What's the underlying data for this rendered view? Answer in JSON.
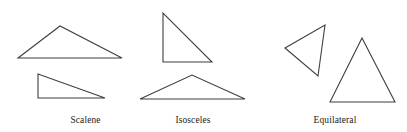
{
  "figure": {
    "background_color": "#ffffff",
    "stroke_color": "#3f3f42",
    "width": 407,
    "height": 132
  },
  "groups": [
    {
      "key": "scalene",
      "label": "Scalene",
      "description": "Triangles with three unequal sides",
      "shapes": [
        {
          "name": "scalene-obtuse-triangle",
          "points": "18,58 60,26 122,58",
          "orientation": "apex-up-left-of-center"
        },
        {
          "name": "scalene-right-triangle",
          "points": "38,74 38,98 105,98",
          "orientation": "right-angle-bottom-left"
        }
      ]
    },
    {
      "key": "isosceles",
      "label": "Isosceles",
      "description": "Triangles with two equal sides",
      "shapes": [
        {
          "name": "isosceles-right-triangle",
          "points": "163,13 163,62 212,62",
          "orientation": "right-angle-bottom-left"
        },
        {
          "name": "isosceles-wide-triangle",
          "points": "140,99 192,75 245,99",
          "orientation": "apex-up-centered"
        }
      ]
    },
    {
      "key": "equilateral",
      "label": "Equilateral",
      "description": "Triangles with three equal sides",
      "shapes": [
        {
          "name": "equilateral-tilted-triangle",
          "points": "285,48 325,25 318,76",
          "orientation": "rotated"
        },
        {
          "name": "equilateral-upright-triangle",
          "points": "330,102 362,38 395,102",
          "orientation": "apex-up-centered"
        }
      ]
    }
  ],
  "chart_data": {
    "type": "diagram",
    "categories": [
      "Scalene",
      "Isosceles",
      "Equilateral"
    ],
    "items": [
      {
        "category": "Scalene",
        "count": 2,
        "examples": [
          "obtuse scalene",
          "right scalene"
        ]
      },
      {
        "category": "Isosceles",
        "count": 2,
        "examples": [
          "right isosceles",
          "wide isosceles"
        ]
      },
      {
        "category": "Equilateral",
        "count": 2,
        "examples": [
          "tilted equilateral",
          "upright equilateral"
        ]
      }
    ],
    "legend_position": "below-each-group",
    "grid": false
  }
}
